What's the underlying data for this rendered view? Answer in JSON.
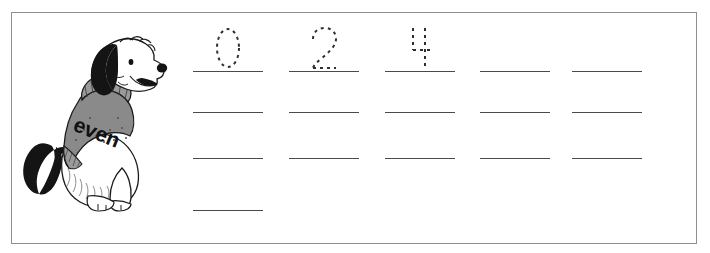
{
  "page": {
    "kind": "handwriting-practice-worksheet",
    "border_color": "#8f8f8f",
    "background_color": "#ffffff",
    "line_color": "#4a4a4a",
    "trace_color": "#2f2f2f"
  },
  "illustration": {
    "name": "sitting-dog-in-sweater",
    "sweater_text": "even",
    "sweater_color": "#8a8a8a",
    "sweater_rib_color": "#9a9a9a",
    "fur_white": "#ffffff",
    "fur_black": "#141414",
    "outline_color": "#1a1a1a"
  },
  "practice_grid": {
    "columns": 5,
    "rows": 4,
    "rows_data": [
      {
        "row_label": "row-1",
        "slots": [
          {
            "traced_digit": "0",
            "value": "0"
          },
          {
            "traced_digit": "2",
            "value": "2"
          },
          {
            "traced_digit": "4",
            "value": "4"
          },
          {
            "traced_digit": "",
            "value": ""
          },
          {
            "traced_digit": "",
            "value": ""
          }
        ]
      },
      {
        "row_label": "row-2",
        "slots": [
          {
            "traced_digit": "",
            "value": ""
          },
          {
            "traced_digit": "",
            "value": ""
          },
          {
            "traced_digit": "",
            "value": ""
          },
          {
            "traced_digit": "",
            "value": ""
          },
          {
            "traced_digit": "",
            "value": ""
          }
        ]
      },
      {
        "row_label": "row-3",
        "slots": [
          {
            "traced_digit": "",
            "value": ""
          },
          {
            "traced_digit": "",
            "value": ""
          },
          {
            "traced_digit": "",
            "value": ""
          },
          {
            "traced_digit": "",
            "value": ""
          },
          {
            "traced_digit": "",
            "value": ""
          }
        ]
      },
      {
        "row_label": "row-4",
        "slots": [
          {
            "traced_digit": "",
            "value": ""
          }
        ]
      }
    ]
  }
}
